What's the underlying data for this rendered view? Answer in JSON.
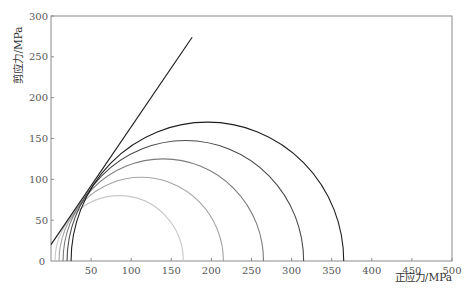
{
  "chart_data": {
    "type": "line",
    "subtype": "mohr-circles-with-failure-envelope",
    "title": "",
    "xlabel": "正应力/MPa",
    "ylabel": "剪应力/MPa",
    "xlim": [
      0,
      500
    ],
    "ylim": [
      0,
      300
    ],
    "x_ticks": [
      50,
      100,
      150,
      200,
      250,
      300,
      350,
      400,
      450,
      500
    ],
    "y_ticks": [
      0,
      50,
      100,
      150,
      200,
      250,
      300
    ],
    "grid": false,
    "legend": null,
    "circles": [
      {
        "name": "circle-1",
        "sigma3": 5,
        "sigma1": 165,
        "center": 85,
        "radius": 80,
        "color": "#c8c8c8"
      },
      {
        "name": "circle-2",
        "sigma3": 10,
        "sigma1": 215,
        "center": 112.5,
        "radius": 102.5,
        "color": "#a4a4a4"
      },
      {
        "name": "circle-3",
        "sigma3": 15,
        "sigma1": 265,
        "center": 140,
        "radius": 125,
        "color": "#7c7c7c"
      },
      {
        "name": "circle-4",
        "sigma3": 20,
        "sigma1": 315,
        "center": 167.5,
        "radius": 147.5,
        "color": "#4a4a4a"
      },
      {
        "name": "circle-5",
        "sigma3": 25,
        "sigma1": 365,
        "center": 195,
        "radius": 170,
        "color": "#1e1e1e"
      }
    ],
    "series": [
      {
        "name": "failure-envelope",
        "x": [
          0,
          176
        ],
        "y": [
          20,
          274
        ],
        "color": "#222222"
      }
    ]
  },
  "axes": {
    "x_origin_label": "0",
    "x_label": "正应力/MPa",
    "y_label": "剪应力/MPa"
  }
}
